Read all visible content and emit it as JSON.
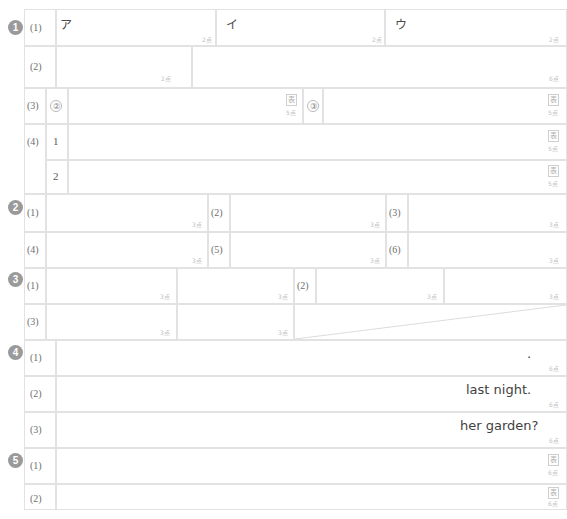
{
  "sheet": {
    "kind": "answer-sheet-grid",
    "width": 567,
    "height": 519,
    "line_color": "#e2e2e2",
    "badge_color": "#9a9a9a",
    "points_color": "#c2c2c2",
    "text_color": "#3f3f3f"
  },
  "marks": {
    "kanji_box": "表",
    "points_2": "2点",
    "points_3": "3点",
    "points_5": "5点",
    "points_6": "6点"
  },
  "sections": [
    {
      "number": "1",
      "questions": [
        {
          "label": "(1)",
          "slots": [
            {
              "prompt": "ア",
              "points": "2点"
            },
            {
              "prompt": "イ",
              "points": "2点"
            },
            {
              "prompt": "ウ",
              "points": "2点"
            }
          ]
        },
        {
          "label": "(2)",
          "slots": [
            {
              "prompt": "",
              "points": "2点"
            },
            {
              "prompt": "",
              "points": "6点"
            }
          ]
        },
        {
          "label": "(3)",
          "slots": [
            {
              "prompt": "②",
              "points": "5点",
              "mark": "表"
            },
            {
              "prompt": "③",
              "points": "5点",
              "mark": "表"
            }
          ]
        },
        {
          "label": "(4)",
          "slots": [
            {
              "prompt": "1",
              "points": "5点",
              "mark": "表"
            },
            {
              "prompt": "2",
              "points": "5点",
              "mark": "表"
            }
          ]
        }
      ]
    },
    {
      "number": "2",
      "questions": [
        {
          "label": "(1)",
          "points": "3点"
        },
        {
          "label": "(2)",
          "points": "3点"
        },
        {
          "label": "(3)",
          "points": "3点"
        },
        {
          "label": "(4)",
          "points": "3点"
        },
        {
          "label": "(5)",
          "points": "3点"
        },
        {
          "label": "(6)",
          "points": "3点"
        }
      ]
    },
    {
      "number": "3",
      "questions": [
        {
          "label": "(1)",
          "points_left": "3点",
          "points_mid": "3点"
        },
        {
          "label": "(2)",
          "points_left": "3点",
          "points_right": "3点"
        },
        {
          "label": "(3)",
          "points_left": "3点",
          "points_mid": "3点"
        }
      ]
    },
    {
      "number": "4",
      "questions": [
        {
          "label": "(1)",
          "tail": ".",
          "points": "6点"
        },
        {
          "label": "(2)",
          "tail": "last night.",
          "points": "6点"
        },
        {
          "label": "(3)",
          "tail": "her garden?",
          "points": "6点"
        }
      ]
    },
    {
      "number": "5",
      "questions": [
        {
          "label": "(1)",
          "points": "6点",
          "mark": "表"
        },
        {
          "label": "(2)",
          "points": "6点",
          "mark": "表"
        }
      ]
    }
  ]
}
